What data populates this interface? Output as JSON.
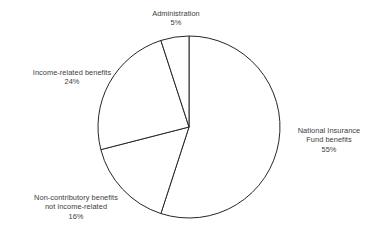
{
  "page": {
    "background_color": "#ffffff",
    "text_color": "#3c3c3c",
    "outline_color": "#262626"
  },
  "chart_data": {
    "type": "pie",
    "title": "",
    "subtitle": "",
    "xlabel": "",
    "ylabel": "",
    "grid": false,
    "legend_position": "outside-labels",
    "start_angle_deg": 0,
    "direction": "clockwise",
    "units": "percent",
    "total": 100,
    "categories": [
      "National Insurance Fund benefits",
      "Non-contributory benefits not income-related",
      "Income-related benefits",
      "Administration"
    ],
    "values": [
      55,
      16,
      24,
      5
    ],
    "slices": [
      {
        "id": "national-insurance-fund",
        "label_lines": [
          "National Insurance",
          "Fund benefits"
        ],
        "percent_text": "55%",
        "value": 55,
        "fill": "#ffffff",
        "stroke": "#262626"
      },
      {
        "id": "non-contributory",
        "label_lines": [
          "Non-contributory benefits",
          "not income-related"
        ],
        "percent_text": "16%",
        "value": 16,
        "fill": "#ffffff",
        "stroke": "#262626"
      },
      {
        "id": "income-related",
        "label_lines": [
          "Income-related benefits"
        ],
        "percent_text": "24%",
        "value": 24,
        "fill": "#ffffff",
        "stroke": "#262626"
      },
      {
        "id": "administration",
        "label_lines": [
          "Administration"
        ],
        "percent_text": "5%",
        "value": 5,
        "fill": "#ffffff",
        "stroke": "#262626"
      }
    ],
    "geometry": {
      "center_x": 189,
      "center_y": 127,
      "radius": 91
    }
  },
  "labels": {
    "administration": {
      "line1": "Administration",
      "pct": "5%"
    },
    "income_related": {
      "line1": "Income-related benefits",
      "pct": "24%"
    },
    "national_insurance": {
      "line1": "National Insurance",
      "line2": "Fund benefits",
      "pct": "55%"
    },
    "non_contributory": {
      "line1": "Non-contributory benefits",
      "line2": "not income-related",
      "pct": "16%"
    }
  }
}
